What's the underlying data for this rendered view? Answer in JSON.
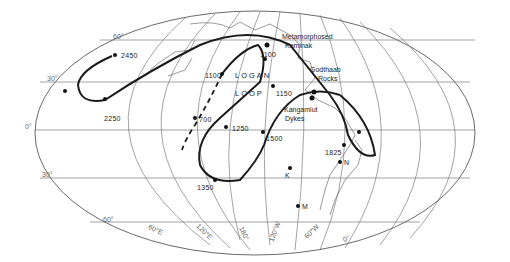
{
  "map": {
    "projection": "equal-area world map (oval)",
    "path_label": [
      "LOGAN",
      "LOOP"
    ],
    "latitude_labels": [
      "60°",
      "30°",
      "0°",
      "30°",
      "60°"
    ],
    "longitude_labels": [
      "60°E",
      "120°E",
      "180°",
      "120°W",
      "60°W",
      "0°"
    ],
    "pole_ages": [
      {
        "label": "2450"
      },
      {
        "label": "2250"
      },
      {
        "label": "1100"
      },
      {
        "label": "700"
      },
      {
        "label": "1250"
      },
      {
        "label": "1150"
      },
      {
        "label": "1500"
      },
      {
        "label": "1350"
      },
      {
        "label": "1100"
      },
      {
        "label": "1825"
      }
    ],
    "localities": [
      {
        "label": "Metamorphosed Kaminak",
        "line1": "Metamorphosed",
        "line2": "Kaminak"
      },
      {
        "label": "Godthaab Rocks",
        "line1": "Godthaab",
        "line2": "Rocks"
      },
      {
        "label": "Kangamiut Dykes",
        "line1": "Kangamiut",
        "line2": "Dykes"
      }
    ],
    "points": [
      {
        "label": "K"
      },
      {
        "label": "N"
      },
      {
        "label": "M"
      }
    ],
    "colors": {
      "ink": "#1a1a1a",
      "grid": "#555555",
      "background": "#ffffff"
    }
  }
}
